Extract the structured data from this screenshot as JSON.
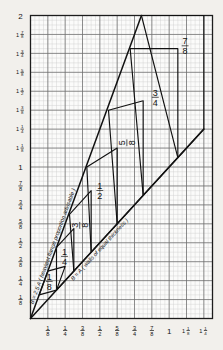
{
  "chart_data": {
    "type": "line",
    "title": "",
    "xlabel": "",
    "ylabel": "",
    "xlim": [
      0,
      1.3125
    ],
    "ylim": [
      0,
      2
    ],
    "grid": true,
    "grid_major_step": 0.125,
    "grid_minor_step": 0.03125,
    "legend": "none",
    "x_tick_values": [
      0.125,
      0.25,
      0.375,
      0.5,
      0.625,
      0.75,
      0.875,
      1.0,
      1.125,
      1.25
    ],
    "x_tick_labels": [
      {
        "whole": "",
        "num": "1",
        "den": "8"
      },
      {
        "whole": "",
        "num": "1",
        "den": "4"
      },
      {
        "whole": "",
        "num": "3",
        "den": "8"
      },
      {
        "whole": "",
        "num": "1",
        "den": "2"
      },
      {
        "whole": "",
        "num": "5",
        "den": "8"
      },
      {
        "whole": "",
        "num": "3",
        "den": "4"
      },
      {
        "whole": "",
        "num": "7",
        "den": "8"
      },
      {
        "whole": "1",
        "num": "",
        "den": ""
      },
      {
        "whole": "1",
        "num": "1",
        "den": "8"
      },
      {
        "whole": "1",
        "num": "1",
        "den": "4"
      }
    ],
    "y_tick_values": [
      0.125,
      0.25,
      0.375,
      0.5,
      0.625,
      0.75,
      0.875,
      1.0,
      1.125,
      1.25,
      1.375,
      1.5,
      1.625,
      1.75,
      1.875,
      2.0
    ],
    "y_tick_labels": [
      {
        "whole": "",
        "num": "1",
        "den": "8"
      },
      {
        "whole": "",
        "num": "1",
        "den": "4"
      },
      {
        "whole": "",
        "num": "3",
        "den": "8"
      },
      {
        "whole": "",
        "num": "1",
        "den": "2"
      },
      {
        "whole": "",
        "num": "5",
        "den": "8"
      },
      {
        "whole": "",
        "num": "3",
        "den": "4"
      },
      {
        "whole": "",
        "num": "7",
        "den": "8"
      },
      {
        "whole": "1",
        "num": "",
        "den": ""
      },
      {
        "whole": "1",
        "num": "1",
        "den": "8"
      },
      {
        "whole": "1",
        "num": "1",
        "den": "4"
      },
      {
        "whole": "1",
        "num": "3",
        "den": "8"
      },
      {
        "whole": "1",
        "num": "1",
        "den": "2"
      },
      {
        "whole": "1",
        "num": "5",
        "den": "8"
      },
      {
        "whole": "1",
        "num": "3",
        "den": "4"
      },
      {
        "whole": "1",
        "num": "7",
        "den": "8"
      },
      {
        "whole": "2",
        "num": "",
        "den": ""
      }
    ],
    "series": [
      {
        "name": "upper-ray",
        "label": "B = 2.5 A (heaviest flange proportion advisable)",
        "slope": 2.5,
        "x": [
          0,
          0.8
        ],
        "y": [
          0,
          2.0
        ]
      },
      {
        "name": "lower-ray",
        "label": "B = A (walls of equal thickness)",
        "slope": 1.0,
        "x": [
          0,
          1.25
        ],
        "y": [
          0,
          1.25
        ]
      }
    ],
    "diamonds": [
      {
        "label_num": "1",
        "label_den": "8",
        "lower": [
          0.1875,
          0.1875
        ],
        "upper": [
          0.125,
          0.3125
        ],
        "inner": [
          0.0625,
          0.15625
        ],
        "outer": [
          0.25,
          0.34375
        ]
      },
      {
        "label_num": "1",
        "label_den": "4",
        "lower": [
          0.3125,
          0.3125
        ],
        "upper": [
          0.1875,
          0.46875
        ],
        "inner": [
          0.1875,
          0.1875
        ],
        "outer": [
          0.3125,
          0.59375
        ]
      },
      {
        "label_num": "3",
        "label_den": "8",
        "lower": [
          0.4375,
          0.4375
        ],
        "upper": [
          0.28125,
          0.6875
        ],
        "inner": [
          0.3125,
          0.3125
        ],
        "outer": [
          0.4375,
          0.84375
        ]
      },
      {
        "label_num": "1",
        "label_den": "2",
        "lower": [
          0.625,
          0.625
        ],
        "upper": [
          0.40625,
          1.0
        ],
        "inner": [
          0.4375,
          0.4375
        ],
        "outer": [
          0.625,
          1.125
        ]
      },
      {
        "label_num": "5",
        "label_den": "8",
        "lower": [
          0.8125,
          0.8125
        ],
        "upper": [
          0.5625,
          1.375
        ],
        "inner": [
          0.625,
          0.625
        ],
        "outer": [
          0.8125,
          1.4375
        ]
      },
      {
        "label_num": "3",
        "label_den": "4",
        "lower": [
          1.0625,
          1.0625
        ],
        "upper": [
          0.71875,
          1.78125
        ],
        "inner": [
          0.8125,
          0.8125
        ],
        "outer": [
          1.0625,
          1.78125
        ]
      },
      {
        "label_num": "7",
        "label_den": "8",
        "lower": [
          1.25,
          1.25
        ],
        "upper": [
          0.8,
          2.0
        ],
        "inner": [
          1.0625,
          1.0625
        ],
        "outer": [
          1.25,
          2.0
        ]
      }
    ],
    "diamond_labels": [
      {
        "text_num": "1",
        "text_den": "8",
        "x": 0.135,
        "y": 0.245,
        "rotate": 0
      },
      {
        "text_num": "1",
        "text_den": "4",
        "x": 0.245,
        "y": 0.41,
        "rotate": 0
      },
      {
        "text_num": "3",
        "text_den": "8",
        "x": 0.355,
        "y": 0.615,
        "rotate": -90
      },
      {
        "text_num": "1",
        "text_den": "2",
        "x": 0.5,
        "y": 0.845,
        "rotate": 0
      },
      {
        "text_num": "5",
        "text_den": "8",
        "x": 0.695,
        "y": 1.16,
        "rotate": -90
      },
      {
        "text_num": "3",
        "text_den": "4",
        "x": 0.9,
        "y": 1.46,
        "rotate": 0
      },
      {
        "text_num": "7",
        "text_den": "8",
        "x": 1.115,
        "y": 1.8,
        "rotate": 0
      }
    ],
    "annotations": [
      {
        "name": "upper-ray-label",
        "text": "B = 2.5 A ( heaviest  flange  proportion  advisable )"
      },
      {
        "name": "lower-ray-label",
        "text": "B = A ( walls of equal thickness )"
      }
    ],
    "colors": {
      "background": "#f2f0ec",
      "plot_background": "#fbfbfa",
      "grid_minor": "#c8c8c8",
      "grid_major": "#5a5a5a",
      "axis": "#1d1d1d",
      "curve": "#111111",
      "text": "#131313"
    }
  }
}
